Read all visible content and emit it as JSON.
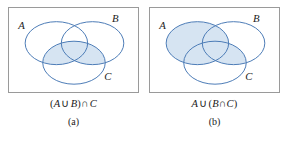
{
  "figure": {
    "type": "venn-diagram-pair",
    "stroke_color": "#4a7ab5",
    "shade_color": "#d6e4f2",
    "box_border_color": "#9a9a9a",
    "panels": [
      {
        "id": "a",
        "label": "(a)",
        "expression": {
          "full": "(A ∪ B) ∩ C",
          "open_paren": "(",
          "left_set": "A",
          "union_op": "∪",
          "right_set": "B",
          "close_paren": ")",
          "intersect_op": "∩",
          "last_set": "C"
        },
        "set_labels": {
          "a": "A",
          "b": "B",
          "c": "C"
        },
        "shaded_regions": [
          "A∩C",
          "B∩C",
          "A∩B∩C"
        ],
        "description": "Three overlapping circles A, B, C; the portion of C that overlaps A or B is shaded."
      },
      {
        "id": "b",
        "label": "(b)",
        "expression": {
          "full": "A ∪ (B ∩ C)",
          "first_set": "A",
          "union_op": "∪",
          "open_paren": "(",
          "left_set": "B",
          "intersect_op": "∩",
          "right_set": "C",
          "close_paren": ")"
        },
        "set_labels": {
          "a": "A",
          "b": "B",
          "c": "C"
        },
        "shaded_regions": [
          "A",
          "B∩C"
        ],
        "description": "Three overlapping circles A, B, C; all of A plus the lens where B meets C is shaded."
      }
    ]
  }
}
